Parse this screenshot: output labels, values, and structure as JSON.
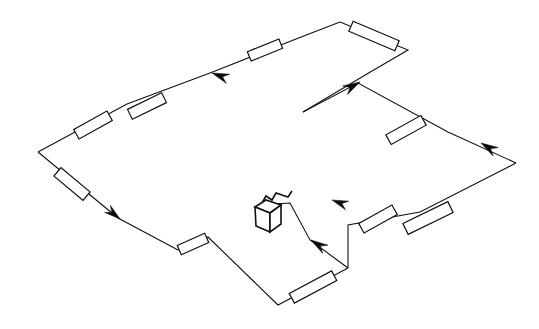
{
  "figure": {
    "kind": "line-diagram",
    "background_color": "#ffffff",
    "line_color": "#111111",
    "arrow_color": "#0b0b0b",
    "canvas": {
      "width": 539,
      "height": 329
    }
  },
  "geometry": {
    "main_loop_points": "340,22 408,50 303,112 358,83 448,132 516,163 348,268 278,305 208,237 178,250 118,218 38,152 210,73",
    "outer_upper_path": "38,152 127,104 210,73 296,39 340,22",
    "upper_right_path": "340,22 408,50 372,71 303,112",
    "mid_right_path": "303,112 358,83 448,132 516,163",
    "lower_right_path": "516,163 420,212 348,225 348,268",
    "center_return_path": "348,268 310,240 290,203 258,205",
    "left_descent_path": "38,152 118,218 178,250",
    "bottom_path": "178,250 208,237 278,305 348,268",
    "box_anchor_path": "258,205 272,198 276,208"
  },
  "segments": [
    {
      "name": "conveyor-segment-upper-left",
      "cx": 93,
      "cy": 125,
      "angle": -29,
      "len": 38,
      "wid": 11
    },
    {
      "name": "conveyor-segment-upper-mid",
      "cx": 147,
      "cy": 106,
      "angle": -26,
      "len": 38,
      "wid": 11
    },
    {
      "name": "conveyor-segment-upper-right",
      "cx": 265,
      "cy": 50,
      "angle": -22,
      "len": 34,
      "wid": 10
    },
    {
      "name": "conveyor-segment-top-corner",
      "cx": 374,
      "cy": 36,
      "angle": 23,
      "len": 50,
      "wid": 11
    },
    {
      "name": "conveyor-segment-left-down",
      "cx": 72,
      "cy": 184,
      "angle": 40,
      "len": 38,
      "wid": 11
    },
    {
      "name": "conveyor-segment-bottom-left",
      "cx": 193,
      "cy": 244,
      "angle": -24,
      "len": 30,
      "wid": 10
    },
    {
      "name": "conveyor-segment-bottom-right",
      "cx": 313,
      "cy": 287,
      "angle": -28,
      "len": 48,
      "wid": 11
    },
    {
      "name": "conveyor-segment-center-right",
      "cx": 378,
      "cy": 219,
      "angle": -29,
      "len": 38,
      "wid": 11
    },
    {
      "name": "conveyor-segment-right-lower",
      "cx": 428,
      "cy": 218,
      "angle": -26,
      "len": 50,
      "wid": 12
    },
    {
      "name": "conveyor-segment-right-upper",
      "cx": 406,
      "cy": 130,
      "angle": -29,
      "len": 40,
      "wid": 11
    }
  ],
  "arrows": [
    {
      "name": "flow-arrow-top-run",
      "x": 212,
      "y": 73,
      "angle": 200,
      "size": 17,
      "direction": "left-down"
    },
    {
      "name": "flow-arrow-left-descent",
      "x": 120,
      "y": 219,
      "angle": 39,
      "size": 16,
      "direction": "down-right"
    },
    {
      "name": "flow-arrow-mid-ascent",
      "x": 360,
      "y": 82,
      "angle": -29,
      "size": 17,
      "direction": "up-right"
    },
    {
      "name": "flow-arrow-right-inbound",
      "x": 481,
      "y": 143,
      "angle": 211,
      "size": 17,
      "direction": "left-up"
    },
    {
      "name": "flow-arrow-center-feed",
      "x": 332,
      "y": 200,
      "angle": 200,
      "size": 16,
      "direction": "left-up"
    },
    {
      "name": "flow-arrow-return-up",
      "x": 311,
      "y": 240,
      "angle": 213,
      "size": 17,
      "direction": "up-left"
    }
  ],
  "machine": {
    "name": "transfer-unit",
    "top_face": "255,207 266,200 281,205 270,213",
    "front_face": "255,207 270,213 270,232 256,226",
    "side_face": "270,213 281,205 281,224 270,232",
    "inlet_path": "262,203 266,196 272,200 276,193 288,197 292,191"
  }
}
